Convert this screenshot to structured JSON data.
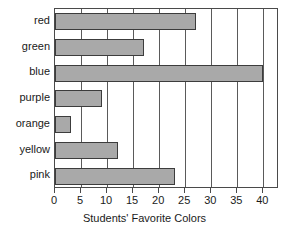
{
  "chart_data": {
    "type": "bar",
    "orientation": "horizontal",
    "title": "",
    "xlabel": "Students' Favorite Colors",
    "ylabel": "",
    "categories": [
      "red",
      "green",
      "blue",
      "purple",
      "orange",
      "yellow",
      "pink"
    ],
    "values": [
      27,
      17,
      40,
      9,
      3,
      12,
      23
    ],
    "xlim": [
      0,
      43
    ],
    "xticks": [
      0,
      5,
      10,
      15,
      20,
      25,
      30,
      35,
      40
    ],
    "xtick_labels": [
      "0",
      "5",
      "10",
      "15",
      "20",
      "25",
      "30",
      "35",
      "40"
    ],
    "grid": "vertical",
    "legend": "none",
    "bar_fill_color": "#a9a9a9",
    "bar_border_color": "#3c3c3c",
    "axis_color": "#4a4a4a",
    "background_color": "#ffffff"
  }
}
